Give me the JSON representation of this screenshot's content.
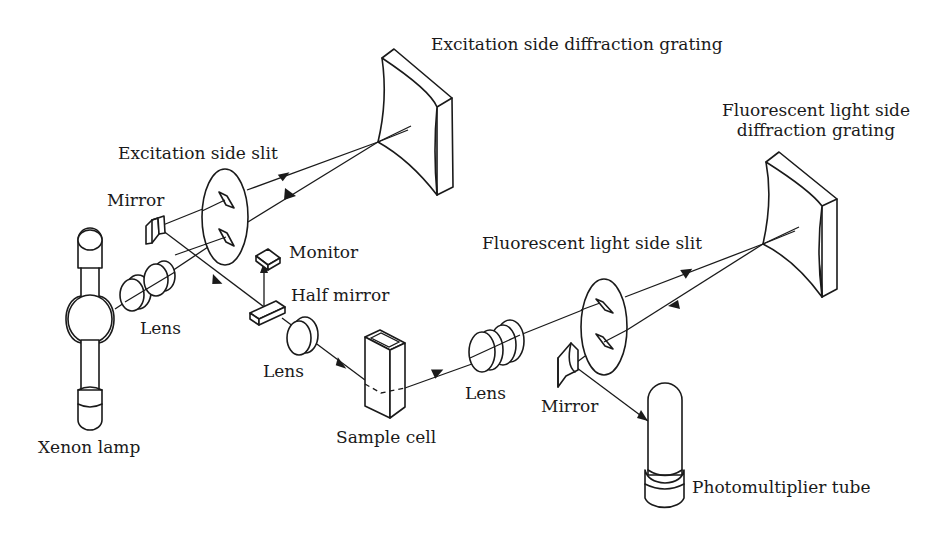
{
  "figure": {
    "colors": {
      "line": "#1a1a1a",
      "background": "#ffffff"
    }
  },
  "labels": {
    "excitation_grating": "Excitation side diffraction grating",
    "excitation_slit": "Excitation side slit",
    "mirror_left": "Mirror",
    "monitor": "Monitor",
    "half_mirror": "Half mirror",
    "lens_left": "Lens",
    "lens_middle": "Lens",
    "lens_right": "Lens",
    "xenon_lamp": "Xenon lamp",
    "sample_cell": "Sample cell",
    "fluorescent_grating_line1": "Fluorescent light side",
    "fluorescent_grating_line2": "diffraction grating",
    "fluorescent_slit": "Fluorescent light side slit",
    "mirror_right": "Mirror",
    "photomultiplier": "Photomultiplier tube"
  },
  "components": [
    {
      "id": "xenon-lamp",
      "icon": "lamp-icon"
    },
    {
      "id": "lens-pair-left",
      "icon": "lens-icon"
    },
    {
      "id": "excitation-slit",
      "icon": "slit-icon"
    },
    {
      "id": "excitation-grating",
      "icon": "concave-grating-icon"
    },
    {
      "id": "mirror-left",
      "icon": "mirror-icon"
    },
    {
      "id": "half-mirror",
      "icon": "half-mirror-icon"
    },
    {
      "id": "monitor",
      "icon": "detector-icon"
    },
    {
      "id": "lens-middle",
      "icon": "lens-icon"
    },
    {
      "id": "sample-cell",
      "icon": "cuvette-icon"
    },
    {
      "id": "lens-pair-right",
      "icon": "lens-icon"
    },
    {
      "id": "fluorescent-slit",
      "icon": "slit-icon"
    },
    {
      "id": "fluorescent-grating",
      "icon": "concave-grating-icon"
    },
    {
      "id": "mirror-right",
      "icon": "mirror-icon"
    },
    {
      "id": "photomultiplier-tube",
      "icon": "pmt-icon"
    }
  ]
}
